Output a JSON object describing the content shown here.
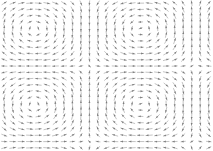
{
  "figure": {
    "title": "",
    "subtitle": "",
    "background_color": "#ffffff",
    "width": 213,
    "height": 151
  },
  "chart_data": {
    "type": "scatter",
    "plot_kind": "quiver",
    "title": "",
    "subtitle": "",
    "xlabel": "",
    "ylabel": "",
    "xlim": [
      0,
      213
    ],
    "ylim": [
      0,
      151
    ],
    "grid": false,
    "axes_visible": false,
    "tick_labels_x": [],
    "tick_labels_y": [],
    "legend": [],
    "legend_position": "none",
    "annotations": [],
    "arrow_color": "#9a9a9a",
    "arrow_head_color": "#7d7d7d",
    "arrow_line_width": 0.6,
    "arrow_head_length": 2.6,
    "arrow_head_width": 1.9,
    "grid_cols": 25,
    "grid_rows": 24,
    "cell_width": 8.52,
    "cell_height": 6.29,
    "arrow_scale": 5.6,
    "field": {
      "description": "Sinusoidal streamfunction flow with nested concentric arc cells",
      "u_expression": "sin(kx * x) * cos(ky * y)",
      "v_expression": "-cos(kx * x) * sin(ky * y)",
      "kx": 0.0295,
      "ky": 0.0416,
      "phase_x": 0.55,
      "phase_y": 0.35,
      "centers": [
        {
          "x": 106,
          "y": 26,
          "type": "cell-center"
        },
        {
          "x": 106,
          "y": 96,
          "type": "cell-center"
        }
      ]
    }
  }
}
